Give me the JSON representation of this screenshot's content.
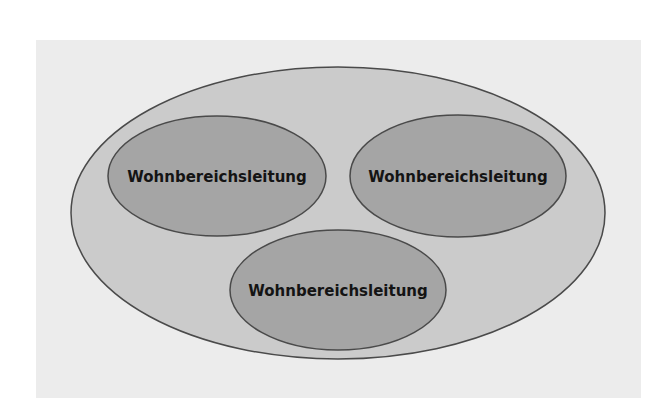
{
  "diagram": {
    "type": "nested-ellipses",
    "colors": {
      "background": "#ffffff",
      "panel": "#ececec",
      "outer_fill": "#cbcbcb",
      "inner_fill": "#a5a5a5",
      "stroke": "#4a4a4a",
      "text": "#141414"
    },
    "outer": {
      "label": ""
    },
    "nodes": [
      {
        "id": "left",
        "label": "Wohnbereichsleitung"
      },
      {
        "id": "right",
        "label": "Wohnbereichsleitung"
      },
      {
        "id": "bottom",
        "label": "Wohnbereichsleitung"
      }
    ]
  }
}
